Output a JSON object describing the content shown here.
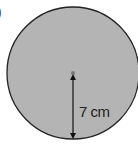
{
  "diagram": {
    "part_marker": ")",
    "shape": "circle",
    "fill_color": "#b4b4b4",
    "stroke_color": "#222222",
    "center": {
      "x": 73,
      "y": 73
    },
    "radius_px": 66,
    "radius_label": "7 cm"
  }
}
